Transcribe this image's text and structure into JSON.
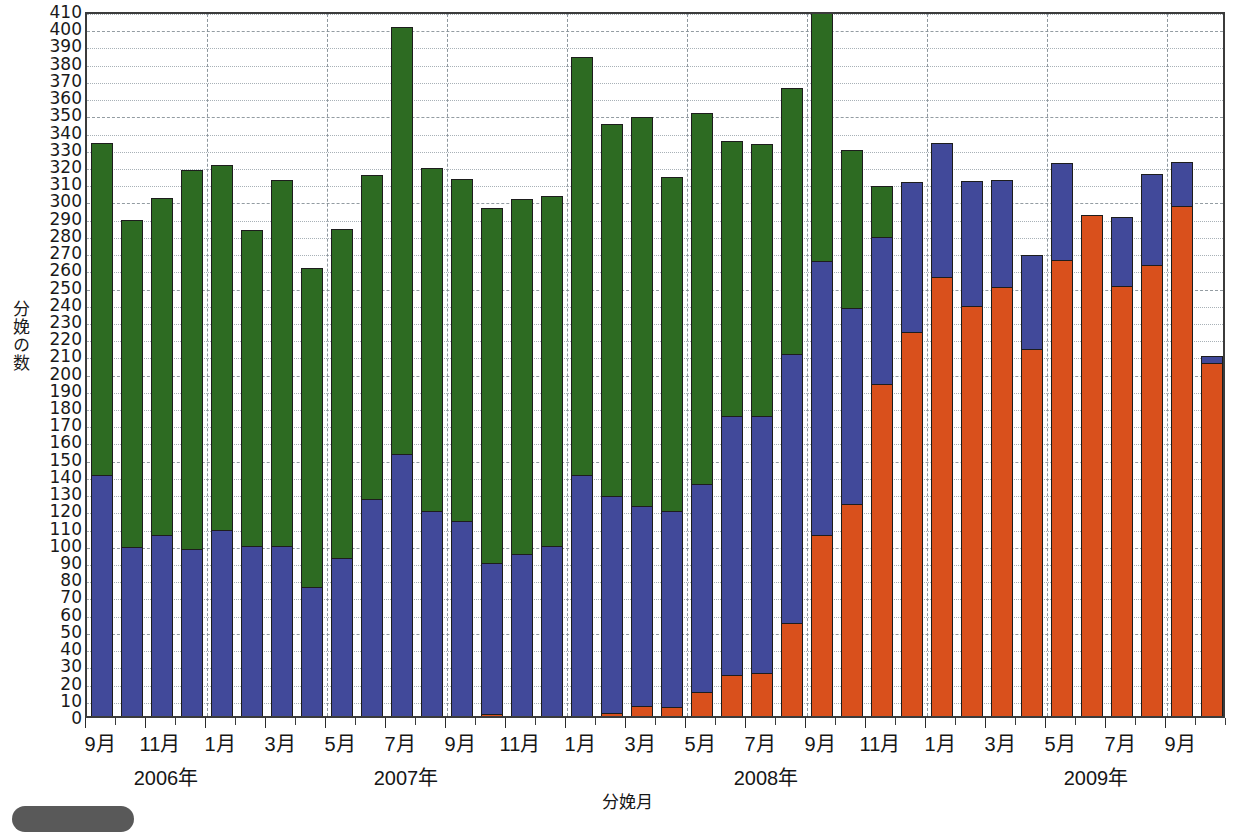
{
  "chart_data": {
    "type": "bar",
    "stacked": true,
    "title": "",
    "xlabel": "分娩月",
    "ylabel": "分娩の数",
    "ylim": [
      0,
      410
    ],
    "ytick_step": 10,
    "yticks": [
      410,
      400,
      390,
      380,
      370,
      360,
      350,
      340,
      330,
      320,
      310,
      300,
      290,
      280,
      270,
      260,
      250,
      240,
      230,
      220,
      210,
      200,
      190,
      180,
      170,
      160,
      150,
      140,
      130,
      120,
      110,
      100,
      90,
      80,
      70,
      60,
      50,
      40,
      30,
      20,
      10,
      0
    ],
    "grid": true,
    "legend_position": "none",
    "series": [
      {
        "name": "orange",
        "color": "#d9501c",
        "values": [
          0,
          0,
          0,
          0,
          0,
          0,
          0,
          0,
          0,
          0,
          0,
          0,
          0,
          1,
          0,
          0,
          0,
          2,
          6,
          5,
          14,
          24,
          25,
          54,
          105,
          123,
          193,
          223,
          255,
          238,
          249,
          213,
          265,
          291,
          250,
          262,
          296,
          205
        ]
      },
      {
        "name": "blue",
        "color": "#41499a",
        "values": [
          140,
          98,
          105,
          97,
          108,
          99,
          99,
          75,
          92,
          126,
          152,
          119,
          113,
          88,
          94,
          99,
          140,
          126,
          116,
          114,
          121,
          150,
          149,
          156,
          159,
          114,
          85,
          87,
          78,
          73,
          62,
          55,
          56,
          0,
          40,
          53,
          26,
          4
        ]
      },
      {
        "name": "green",
        "color": "#2d6b22",
        "values": [
          193,
          190,
          196,
          220,
          212,
          183,
          212,
          185,
          191,
          188,
          248,
          199,
          199,
          206,
          206,
          203,
          243,
          216,
          226,
          194,
          215,
          160,
          158,
          155,
          145,
          92,
          30,
          0,
          0,
          0,
          0,
          0,
          0,
          0,
          0,
          0,
          0,
          0
        ]
      }
    ],
    "categories": [
      {
        "month": "9月",
        "year": "2006年",
        "total": 333
      },
      {
        "month": "10月",
        "year": "",
        "total": 288
      },
      {
        "month": "11月",
        "year": "",
        "total": 301
      },
      {
        "month": "12月",
        "year": "",
        "total": 317
      },
      {
        "month": "1月",
        "year": "2007年",
        "total": 320
      },
      {
        "month": "2月",
        "year": "",
        "total": 282
      },
      {
        "month": "3月",
        "year": "",
        "total": 311
      },
      {
        "month": "4月",
        "year": "",
        "total": 260
      },
      {
        "month": "5月",
        "year": "",
        "total": 283
      },
      {
        "month": "6月",
        "year": "",
        "total": 314
      },
      {
        "month": "7月",
        "year": "",
        "total": 400
      },
      {
        "month": "8月",
        "year": "",
        "total": 318
      },
      {
        "month": "9月",
        "year": "",
        "total": 312
      },
      {
        "month": "10月",
        "year": "",
        "total": 295
      },
      {
        "month": "11月",
        "year": "",
        "total": 300
      },
      {
        "month": "12月",
        "year": "",
        "total": 302
      },
      {
        "month": "1月",
        "year": "2008年",
        "total": 389
      },
      {
        "month": "2月",
        "year": "",
        "total": 344
      },
      {
        "month": "3月",
        "year": "",
        "total": 348
      },
      {
        "month": "4月",
        "year": "",
        "total": 313
      },
      {
        "month": "5月",
        "year": "",
        "total": 350
      },
      {
        "month": "6月",
        "year": "",
        "total": 334
      },
      {
        "month": "7月",
        "year": "",
        "total": 332
      },
      {
        "month": "8月",
        "year": "",
        "total": 365
      },
      {
        "month": "9月",
        "year": "",
        "total": 409
      },
      {
        "month": "10月",
        "year": "",
        "total": 329
      },
      {
        "month": "11月",
        "year": "",
        "total": 308
      },
      {
        "month": "12月",
        "year": "",
        "total": 310
      },
      {
        "month": "1月",
        "year": "2009年",
        "total": 333
      },
      {
        "month": "2月",
        "year": "",
        "total": 311
      },
      {
        "month": "3月",
        "year": "",
        "total": 311
      },
      {
        "month": "4月",
        "year": "",
        "total": 268
      },
      {
        "month": "5月",
        "year": "",
        "total": 321
      },
      {
        "month": "6月",
        "year": "",
        "total": 291
      },
      {
        "month": "7月",
        "year": "",
        "total": 290
      },
      {
        "month": "8月",
        "year": "",
        "total": 315
      },
      {
        "month": "9月",
        "year": "",
        "total": 322
      },
      {
        "month": "10月",
        "year": "",
        "total": 209
      }
    ],
    "xtick_labels": [
      {
        "index": 0,
        "label": "9月"
      },
      {
        "index": 2,
        "label": "11月"
      },
      {
        "index": 4,
        "label": "1月"
      },
      {
        "index": 6,
        "label": "3月"
      },
      {
        "index": 8,
        "label": "5月"
      },
      {
        "index": 10,
        "label": "7月"
      },
      {
        "index": 12,
        "label": "9月"
      },
      {
        "index": 14,
        "label": "11月"
      },
      {
        "index": 16,
        "label": "1月"
      },
      {
        "index": 18,
        "label": "3月"
      },
      {
        "index": 20,
        "label": "5月"
      },
      {
        "index": 22,
        "label": "7月"
      },
      {
        "index": 24,
        "label": "9月"
      },
      {
        "index": 26,
        "label": "11月"
      },
      {
        "index": 28,
        "label": "1月"
      },
      {
        "index": 30,
        "label": "3月"
      },
      {
        "index": 32,
        "label": "5月"
      },
      {
        "index": 34,
        "label": "7月"
      },
      {
        "index": 36,
        "label": "9月"
      }
    ],
    "year_labels": [
      {
        "index": 2.2,
        "label": "2006年"
      },
      {
        "index": 10.2,
        "label": "2007年"
      },
      {
        "index": 22.2,
        "label": "2008年"
      },
      {
        "index": 33.2,
        "label": "2009年"
      }
    ]
  },
  "footer": {
    "badge_label": "",
    "note": ""
  }
}
